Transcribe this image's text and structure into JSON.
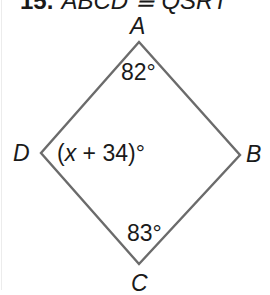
{
  "problem": {
    "number": "15.",
    "statement": "ABCD ≅ QSRT"
  },
  "figure": {
    "shape": "quadrilateral",
    "stroke_color": "#6b6b6b",
    "vertices": [
      {
        "name": "A",
        "x": 139,
        "y": 42
      },
      {
        "name": "B",
        "x": 240,
        "y": 155
      },
      {
        "name": "C",
        "x": 139,
        "y": 264
      },
      {
        "name": "D",
        "x": 41,
        "y": 153
      }
    ],
    "labels": {
      "A": "A",
      "B": "B",
      "C": "C",
      "D": "D"
    },
    "angles": {
      "A": "82°",
      "C": "83°",
      "D_prefix": "(",
      "D_var": "x",
      "D_suffix": " + 34)°"
    }
  }
}
